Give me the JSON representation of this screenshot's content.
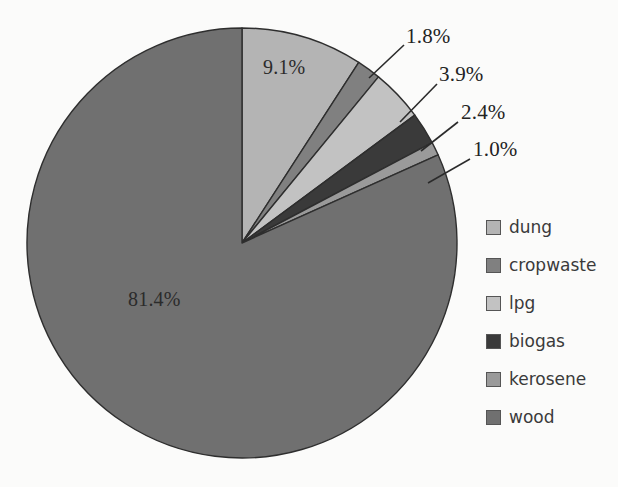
{
  "chart_data": {
    "type": "pie",
    "title": "",
    "categories": [
      "dung",
      "cropwaste",
      "lpg",
      "biogas",
      "kerosene",
      "wood"
    ],
    "values": [
      9.1,
      1.8,
      3.9,
      2.4,
      1.0,
      81.4
    ],
    "value_labels": [
      "9.1%",
      "1.8%",
      "3.9%",
      "2.4%",
      "1.0%",
      "81.4%"
    ],
    "unit": "%",
    "start_angle_deg": 0,
    "direction": "clockwise",
    "legend_position": "right",
    "grid": false,
    "colors": [
      "#b4b4b4",
      "#808080",
      "#c2c2c2",
      "#3a3a3a",
      "#9a9a9a",
      "#707070"
    ],
    "background": "#fbfbfa",
    "outline_color": "#2e2e2e",
    "slices": [
      {
        "label": "dung",
        "value": 9.1,
        "text": "9.1%",
        "color": "#b4b4b4",
        "label_placement": "inside"
      },
      {
        "label": "cropwaste",
        "value": 1.8,
        "text": "1.8%",
        "color": "#808080",
        "label_placement": "callout"
      },
      {
        "label": "lpg",
        "value": 3.9,
        "text": "3.9%",
        "color": "#c2c2c2",
        "label_placement": "callout"
      },
      {
        "label": "biogas",
        "value": 2.4,
        "text": "2.4%",
        "color": "#3a3a3a",
        "label_placement": "callout"
      },
      {
        "label": "kerosene",
        "value": 1.0,
        "text": "1.0%",
        "color": "#9a9a9a",
        "label_placement": "callout"
      },
      {
        "label": "wood",
        "value": 81.4,
        "text": "81.4%",
        "color": "#707070",
        "label_placement": "inside"
      }
    ]
  },
  "legend": {
    "items": [
      {
        "label": "dung",
        "color": "#b4b4b4"
      },
      {
        "label": "cropwaste",
        "color": "#808080"
      },
      {
        "label": "lpg",
        "color": "#c2c2c2"
      },
      {
        "label": "biogas",
        "color": "#3a3a3a"
      },
      {
        "label": "kerosene",
        "color": "#9a9a9a"
      },
      {
        "label": "wood",
        "color": "#707070"
      }
    ]
  },
  "labels": {
    "dung_pct": "9.1%",
    "cropwaste_pct": "1.8%",
    "lpg_pct": "3.9%",
    "biogas_pct": "2.4%",
    "kerosene_pct": "1.0%",
    "wood_pct": "81.4%"
  }
}
